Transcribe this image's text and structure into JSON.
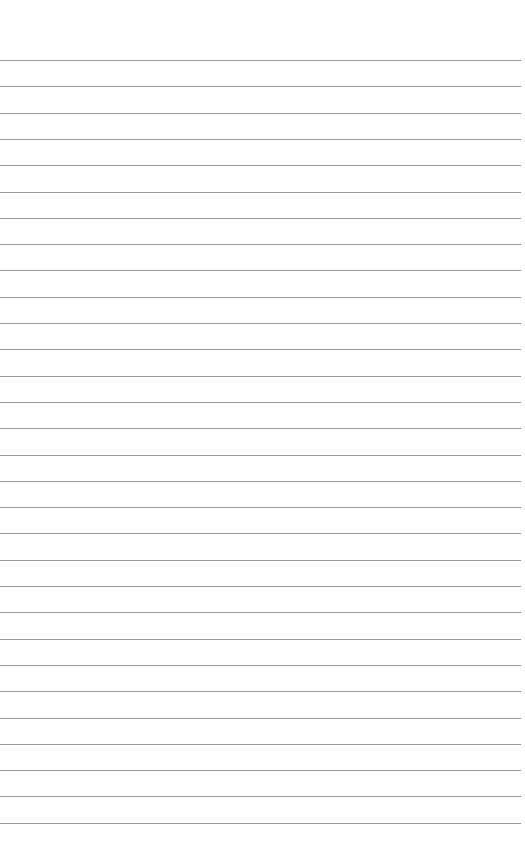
{
  "page": {
    "type": "lined-paper",
    "background_color": "#ffffff",
    "rule_color": "#9a9a9a",
    "first_rule_y": 60,
    "rule_spacing": 26.3,
    "rule_count": 30,
    "text": ""
  }
}
